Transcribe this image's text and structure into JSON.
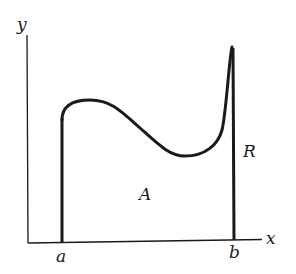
{
  "figure": {
    "axis_labels": {
      "x": "x",
      "y": "y"
    },
    "bound_labels": {
      "left": "a",
      "right": "b"
    },
    "region_labels": {
      "area": "A",
      "region": "R"
    },
    "colors": {
      "ink": "#1a1a1a",
      "background": "#ffffff"
    }
  }
}
